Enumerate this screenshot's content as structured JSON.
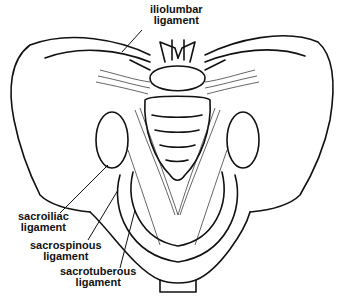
{
  "diagram": {
    "labels": [
      {
        "id": "iliolumbar",
        "line1": "iliolumbar",
        "line2": "ligament"
      },
      {
        "id": "sacroiliac",
        "line1": "sacroiliac",
        "line2": "ligament"
      },
      {
        "id": "sacrospinous",
        "line1": "sacrospinous",
        "line2": "ligament"
      },
      {
        "id": "sacrotuberous",
        "line1": "sacrotuberous",
        "line2": "ligament"
      }
    ]
  }
}
